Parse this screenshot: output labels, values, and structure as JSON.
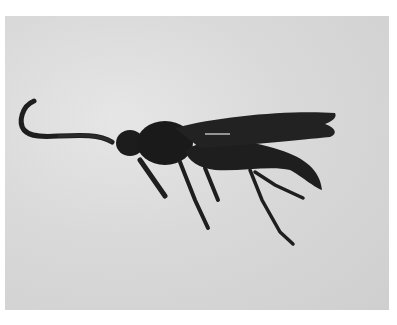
{
  "image": {
    "subject": "wasp",
    "description": "Grayscale photograph of a dark wasp in side profile with a curled antenna, folded wings and long legs against a light gray background",
    "colors": {
      "background": "#d9d9d9",
      "insect": "#1c1c1c",
      "frame": "#ffffff"
    }
  }
}
